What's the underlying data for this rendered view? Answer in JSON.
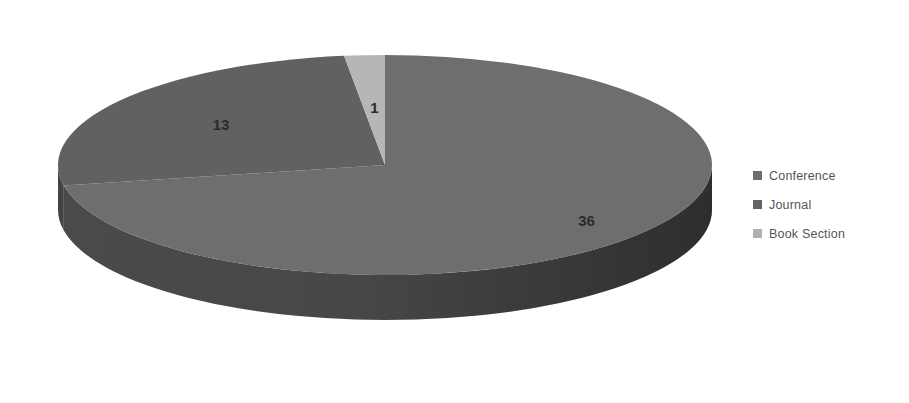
{
  "chart_data": {
    "type": "pie",
    "title": "",
    "subtitle": "",
    "xlabel": "",
    "ylabel": "",
    "three_d": true,
    "grid": false,
    "legend_position": "right",
    "total": 50,
    "start_angle_deg": 0,
    "direction": "clockwise",
    "categories": [
      "Conference",
      "Journal",
      "Book Section"
    ],
    "values": [
      36,
      13,
      1
    ],
    "data_labels": [
      "36",
      "13",
      "1"
    ],
    "slices": [
      {
        "label": "Conference",
        "value": 36,
        "data_label": "36",
        "percent": 72,
        "color": "#6e6e6e",
        "side_color": "#4a4a4a",
        "start_deg": 0,
        "end_deg": 259.2
      },
      {
        "label": "Journal",
        "value": 13,
        "data_label": "13",
        "percent": 26,
        "color": "#616161",
        "side_color": "#434343",
        "start_deg": 259.2,
        "end_deg": 352.8
      },
      {
        "label": "Book Section",
        "value": 1,
        "data_label": "1",
        "percent": 2,
        "color": "#b6b6b6",
        "side_color": "#8e8e8e",
        "start_deg": 352.8,
        "end_deg": 360
      }
    ]
  },
  "legend": {
    "items": [
      {
        "label": "Conference",
        "color": "#6e6e6e"
      },
      {
        "label": "Journal",
        "color": "#636363"
      },
      {
        "label": "Book Section",
        "color": "#b0b0b0"
      }
    ]
  },
  "colors": {
    "background": "#ffffff",
    "conference": "#6e6e6e",
    "journal": "#616161",
    "book_section": "#b6b6b6",
    "label_text": "#2b2b2b",
    "legend_text": "#555555"
  }
}
